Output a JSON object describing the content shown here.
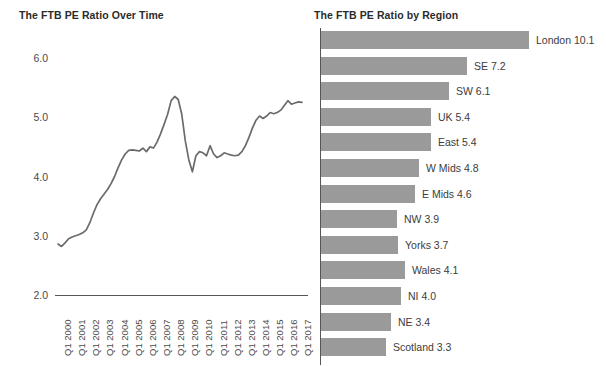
{
  "charts": {
    "line": {
      "title": "The FTB PE Ratio Over Time"
    },
    "bar": {
      "title": "The FTB PE Ratio by Region"
    }
  },
  "chart_data": [
    {
      "type": "line",
      "title": "The FTB PE Ratio Over Time",
      "xlabel": "",
      "ylabel": "",
      "ylim": [
        2.0,
        6.3
      ],
      "yticks": [
        "2.0",
        "3.0",
        "4.0",
        "5.0",
        "6.0"
      ],
      "ytick_values": [
        2.0,
        3.0,
        4.0,
        5.0,
        6.0
      ],
      "grid": false,
      "legend": "none",
      "line_color": "#6b6b6b",
      "categories": [
        "Q1 2000",
        "Q1 2001",
        "Q1 2002",
        "Q1 2003",
        "Q1 2004",
        "Q1 2005",
        "Q1 2006",
        "Q1 2007",
        "Q1 2008",
        "Q1 2009",
        "Q1 2010",
        "Q1 2011",
        "Q1 2012",
        "Q1 2013",
        "Q1 2014",
        "Q1 2015",
        "Q1 2016",
        "Q1 2017"
      ],
      "x_quarterly": [
        "Q1 2000",
        "Q2 2000",
        "Q3 2000",
        "Q4 2000",
        "Q1 2001",
        "Q2 2001",
        "Q3 2001",
        "Q4 2001",
        "Q1 2002",
        "Q2 2002",
        "Q3 2002",
        "Q4 2002",
        "Q1 2003",
        "Q2 2003",
        "Q3 2003",
        "Q4 2003",
        "Q1 2004",
        "Q2 2004",
        "Q3 2004",
        "Q4 2004",
        "Q1 2005",
        "Q2 2005",
        "Q3 2005",
        "Q4 2005",
        "Q1 2006",
        "Q2 2006",
        "Q3 2006",
        "Q4 2006",
        "Q1 2007",
        "Q2 2007",
        "Q3 2007",
        "Q4 2007",
        "Q1 2008",
        "Q2 2008",
        "Q3 2008",
        "Q4 2008",
        "Q1 2009",
        "Q2 2009",
        "Q3 2009",
        "Q4 2009",
        "Q1 2010",
        "Q2 2010",
        "Q3 2010",
        "Q4 2010",
        "Q1 2011",
        "Q2 2011",
        "Q3 2011",
        "Q4 2011",
        "Q1 2012",
        "Q2 2012",
        "Q3 2012",
        "Q4 2012",
        "Q1 2013",
        "Q2 2013",
        "Q3 2013",
        "Q4 2013",
        "Q1 2014",
        "Q2 2014",
        "Q3 2014",
        "Q4 2014",
        "Q1 2015",
        "Q2 2015",
        "Q3 2015",
        "Q4 2015",
        "Q1 2016",
        "Q2 2016",
        "Q3 2016",
        "Q4 2016",
        "Q1 2017",
        "Q2 2017"
      ],
      "values": [
        2.86,
        2.82,
        2.88,
        2.95,
        2.98,
        3.0,
        3.02,
        3.05,
        3.1,
        3.22,
        3.38,
        3.52,
        3.62,
        3.7,
        3.78,
        3.88,
        4.0,
        4.15,
        4.28,
        4.38,
        4.44,
        4.45,
        4.44,
        4.43,
        4.48,
        4.42,
        4.5,
        4.48,
        4.58,
        4.72,
        4.88,
        5.05,
        5.28,
        5.35,
        5.3,
        5.05,
        4.6,
        4.28,
        4.08,
        4.35,
        4.42,
        4.4,
        4.35,
        4.52,
        4.38,
        4.32,
        4.35,
        4.4,
        4.38,
        4.36,
        4.35,
        4.36,
        4.42,
        4.52,
        4.66,
        4.82,
        4.95,
        5.02,
        4.98,
        5.02,
        5.08,
        5.06,
        5.08,
        5.12,
        5.2,
        5.28,
        5.22,
        5.24,
        5.26,
        5.25
      ]
    },
    {
      "type": "bar",
      "orientation": "horizontal",
      "title": "The FTB PE Ratio by Region",
      "xlabel": "",
      "ylabel": "",
      "grid": false,
      "legend": "none",
      "bar_color": "#9a9a9a",
      "categories": [
        "London",
        "SE",
        "SW",
        "UK",
        "East",
        "W Mids",
        "E Mids",
        "NW",
        "Yorks",
        "Wales",
        "NI",
        "NE",
        "Scotland"
      ],
      "values": [
        10.1,
        7.2,
        6.1,
        5.4,
        5.4,
        4.8,
        4.6,
        3.9,
        3.7,
        4.1,
        4.0,
        3.4,
        3.3
      ],
      "bar_pixel_widths": [
        208,
        146,
        128,
        110,
        110,
        98,
        94,
        76,
        77,
        84,
        80,
        70,
        65
      ],
      "labels": [
        "London 10.1",
        "SE 7.2",
        "SW 6.1",
        "UK 5.4",
        "East 5.4",
        "W Mids 4.8",
        "E Mids 4.6",
        "NW 3.9",
        "Yorks 3.7",
        "Wales 4.1",
        "NI 4.0",
        "NE 3.4",
        "Scotland 3.3"
      ]
    }
  ]
}
